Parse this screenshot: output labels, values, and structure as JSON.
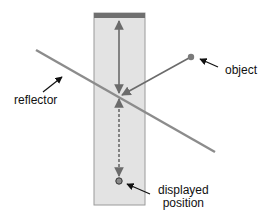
{
  "diagram": {
    "type": "reflection-geometry",
    "labels": {
      "reflector": "reflector",
      "object": "object",
      "displayed_line1": "displayed",
      "displayed_line2": "position"
    },
    "colors": {
      "panel_fill": "#e3e3e3",
      "panel_border": "#9a9a9a",
      "top_bar": "#6f6f6f",
      "reflector": "#8c8c8c",
      "ray": "#6b6b6b",
      "object_dot": "#7a7a7a",
      "pointer": "#111111"
    }
  }
}
